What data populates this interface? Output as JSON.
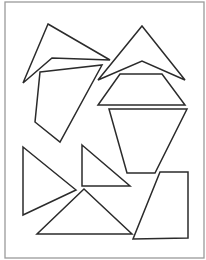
{
  "diagram": {
    "title": "",
    "stroke_color": "#2b2b2b",
    "frame_color": "#9a9a9a",
    "background": "#ffffff",
    "frame": {
      "x": 5,
      "y": 2,
      "width": 199,
      "height": 256
    },
    "pieces": [
      {
        "name": "top-left-triangle",
        "points": "48,24 110,60 52,58 23,83"
      },
      {
        "name": "left-quadrilateral",
        "points": "40,72 102,65 60,142 35,122"
      },
      {
        "name": "top-right-arrowhead",
        "points": "142,26 185,80 142,61 98,80"
      },
      {
        "name": "right-trapezoid",
        "points": "120,74 162,74 185,105 98,105"
      },
      {
        "name": "right-inverted-trapezoid",
        "points": "109,109 187,109 155,173 127,173"
      },
      {
        "name": "bottom-right-quadrilateral",
        "points": "160,172 188,172 188,238 133,239"
      },
      {
        "name": "left-tall-triangle",
        "points": "23,147 76,190 23,215"
      },
      {
        "name": "middle-right-triangle",
        "points": "82,145 130,186 82,186"
      },
      {
        "name": "bottom-triangle",
        "points": "84,189 132,234 37,234"
      }
    ]
  }
}
